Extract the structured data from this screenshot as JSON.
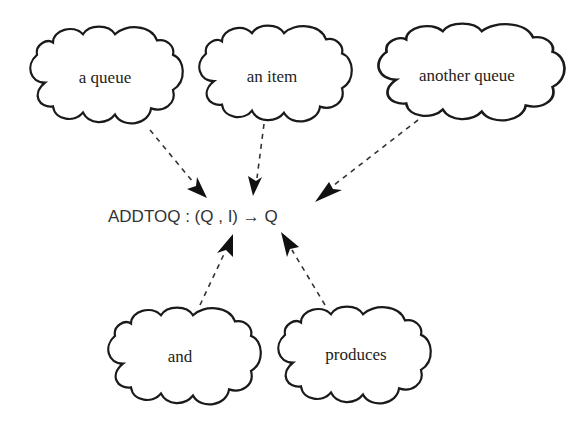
{
  "diagram": {
    "formula": "ADDTOQ : (Q , I) → Q",
    "clouds": [
      {
        "id": "a-queue",
        "label": "a queue"
      },
      {
        "id": "an-item",
        "label": "an item"
      },
      {
        "id": "another-queue",
        "label": "another queue"
      },
      {
        "id": "and",
        "label": "and"
      },
      {
        "id": "produces",
        "label": "produces"
      }
    ],
    "arrows": [
      {
        "from": "a queue",
        "to": "(Q"
      },
      {
        "from": "an item",
        "to": "I)"
      },
      {
        "from": "another queue",
        "to": "→ Q"
      },
      {
        "from": "and",
        "to": "(Q , I)"
      },
      {
        "from": "produces",
        "to": "→ Q"
      }
    ],
    "colors": {
      "stroke": "#1a1a1a",
      "text": "#222222",
      "background": "#ffffff"
    }
  }
}
